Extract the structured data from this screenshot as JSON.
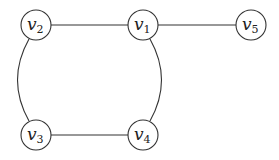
{
  "diagram": {
    "type": "undirected-graph",
    "nodes": [
      {
        "id": "v1",
        "base": "v",
        "sub": "1",
        "x": 143,
        "y": 25
      },
      {
        "id": "v2",
        "base": "v",
        "sub": "2",
        "x": 36,
        "y": 25
      },
      {
        "id": "v3",
        "base": "v",
        "sub": "3",
        "x": 36,
        "y": 135
      },
      {
        "id": "v4",
        "base": "v",
        "sub": "4",
        "x": 143,
        "y": 135
      },
      {
        "id": "v5",
        "base": "v",
        "sub": "5",
        "x": 251,
        "y": 25
      }
    ],
    "edges": [
      {
        "from": "v2",
        "to": "v1",
        "shape": "straight"
      },
      {
        "from": "v1",
        "to": "v5",
        "shape": "straight"
      },
      {
        "from": "v3",
        "to": "v4",
        "shape": "straight"
      },
      {
        "from": "v2",
        "to": "v3",
        "shape": "arc-left"
      },
      {
        "from": "v1",
        "to": "v4",
        "shape": "arc-right"
      }
    ],
    "node_radius": 15,
    "colors": {
      "stroke": "#333333",
      "fill": "#ffffff",
      "text": "#222222"
    }
  }
}
